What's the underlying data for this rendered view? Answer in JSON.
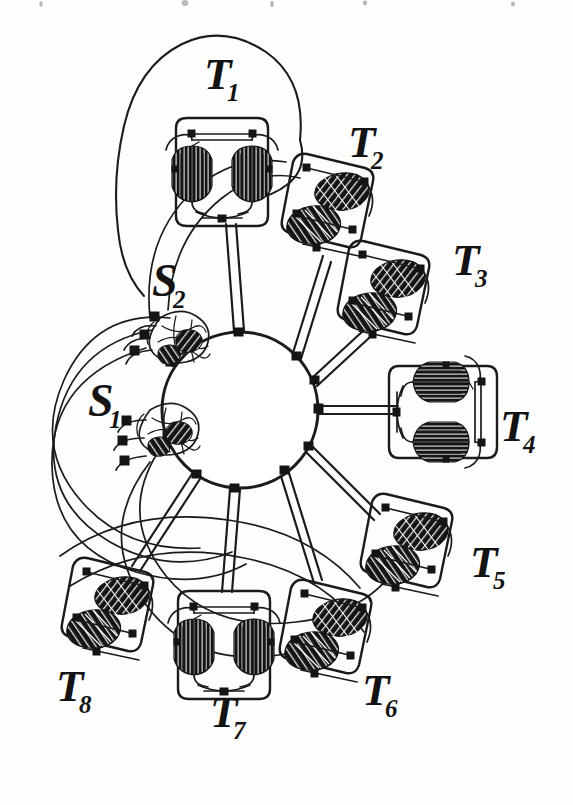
{
  "figure": {
    "kind": "hand-drawn hub-and-spoke topological graph diagram",
    "background_color": "#fefefe",
    "ink_color": "#1b1b1b",
    "blob_color": "#171717",
    "width": 573,
    "height": 805
  },
  "hub": {
    "name": "central-hub",
    "shape": "circle",
    "cx": 240,
    "cy": 410,
    "r": 78,
    "port_count": 11
  },
  "tree_nodes": [
    {
      "id": "T1",
      "base": "T",
      "sub": "1",
      "label_x": 204,
      "label_y": 52,
      "cx": 222,
      "cy": 172,
      "style": "upright",
      "enclosed_by_hull": true
    },
    {
      "id": "T2",
      "base": "T",
      "sub": "2",
      "label_x": 348,
      "label_y": 120,
      "cx": 333,
      "cy": 208,
      "style": "rotated"
    },
    {
      "id": "T3",
      "base": "T",
      "sub": "3",
      "label_x": 452,
      "label_y": 238,
      "cx": 389,
      "cy": 295,
      "style": "rotated"
    },
    {
      "id": "T4",
      "base": "T",
      "sub": "4",
      "label_x": 500,
      "label_y": 404,
      "cx": 443,
      "cy": 412,
      "style": "upright"
    },
    {
      "id": "T5",
      "base": "T",
      "sub": "5",
      "label_x": 470,
      "label_y": 540,
      "cx": 412,
      "cy": 548,
      "style": "rotated"
    },
    {
      "id": "T6",
      "base": "T",
      "sub": "6",
      "label_x": 362,
      "label_y": 668,
      "cx": 331,
      "cy": 634,
      "style": "rotated"
    },
    {
      "id": "T7",
      "base": "T",
      "sub": "7",
      "label_x": 210,
      "label_y": 690,
      "cx": 224,
      "cy": 645,
      "style": "upright"
    },
    {
      "id": "T8",
      "base": "T",
      "sub": "8",
      "label_x": 56,
      "label_y": 664,
      "cx": 113,
      "cy": 612,
      "style": "rotated"
    }
  ],
  "small_nodes": [
    {
      "id": "S2",
      "base": "S",
      "sub": "2",
      "label_x": 152,
      "label_y": 258,
      "cx": 172,
      "cy": 335,
      "port_count": 3
    },
    {
      "id": "S1",
      "base": "S",
      "sub": "1",
      "label_x": 88,
      "label_y": 378,
      "cx": 160,
      "cy": 428,
      "port_count": 3
    }
  ],
  "edges": {
    "spoke_style": "double-line ribbon",
    "spokes": [
      {
        "from": "hub",
        "to": "T1"
      },
      {
        "from": "hub",
        "to": "T2"
      },
      {
        "from": "hub",
        "to": "T3"
      },
      {
        "from": "hub",
        "to": "T4"
      },
      {
        "from": "hub",
        "to": "T5"
      },
      {
        "from": "hub",
        "to": "T6"
      },
      {
        "from": "hub",
        "to": "T7"
      },
      {
        "from": "hub",
        "to": "T8"
      },
      {
        "from": "hub",
        "to": "S1"
      },
      {
        "from": "hub",
        "to": "S2"
      }
    ],
    "long_curve_count": 6,
    "long_curve_style": "thin sweeping arc around left side"
  }
}
